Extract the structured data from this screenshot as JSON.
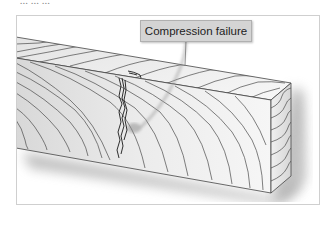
{
  "figure": {
    "caption_fragment": "... ... ...",
    "callout": {
      "label": "Compression failure"
    },
    "colors": {
      "frame_border": "#cfcfcf",
      "callout_bg": "#d4d4d4",
      "grain_line": "#4a4a4a",
      "crack": "#1a1a1a",
      "face_top": "#f1f1f1",
      "face_front": "#e6e6e6",
      "face_end": "#dcdcdc"
    }
  }
}
